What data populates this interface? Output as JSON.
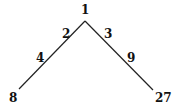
{
  "diagram": {
    "type": "branching-tree",
    "root": {
      "label": "1"
    },
    "left_branch": {
      "labels_along_edge": [
        "2",
        "4"
      ],
      "endpoint": "8"
    },
    "right_branch": {
      "labels_along_edge": [
        "3",
        "9"
      ],
      "endpoint": "27"
    },
    "line_color": "#222222",
    "text_color": "#111111"
  }
}
